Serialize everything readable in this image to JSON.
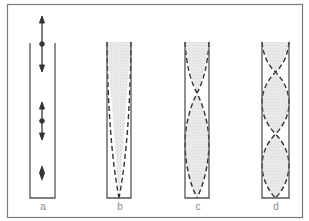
{
  "figure": {
    "colors": {
      "frame": "#7a7a7a",
      "tube_wall": "#555555",
      "dash": "#333333",
      "fill": "#e4e4e4"
    },
    "panels": [
      {
        "id": "a",
        "label": "a",
        "content": "particle displacement arrows"
      },
      {
        "id": "b",
        "label": "b",
        "content": "fundamental (1/4 wavelength)"
      },
      {
        "id": "c",
        "label": "c",
        "content": "third harmonic (3/4 wavelength)"
      },
      {
        "id": "d",
        "label": "d",
        "content": "fifth harmonic (5/4 wavelength)"
      }
    ]
  }
}
